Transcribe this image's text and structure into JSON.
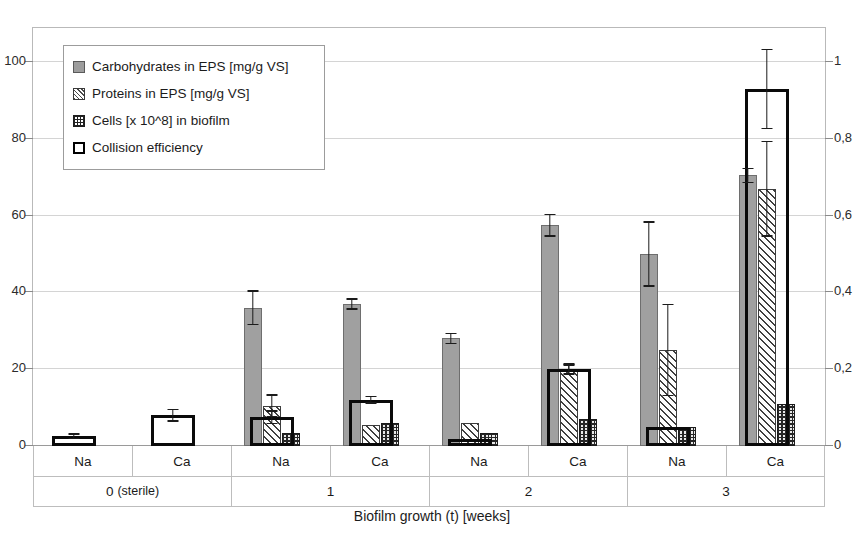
{
  "chart_data": {
    "type": "bar",
    "title": "",
    "xlabel": "Biofilm growth (t) [weeks]",
    "ylabel": "",
    "ylim": [
      0,
      110
    ],
    "y2lim": [
      0,
      1.1
    ],
    "yticks": [
      "0",
      "20",
      "40",
      "60",
      "80",
      "100"
    ],
    "ytick_values": [
      0,
      20,
      40,
      60,
      80,
      100
    ],
    "y2ticks": [
      "0",
      "0,2",
      "0,4",
      "0,6",
      "0,8",
      "1"
    ],
    "y2tick_values": [
      0,
      0.2,
      0.4,
      0.6,
      0.8,
      1
    ],
    "grid": true,
    "legend_position": "top-left",
    "categories": [
      "Na",
      "Ca",
      "Na",
      "Ca",
      "Na",
      "Ca",
      "Na",
      "Ca"
    ],
    "groups": [
      {
        "label": "0",
        "sublabel": "(sterile)",
        "span": 2
      },
      {
        "label": "1",
        "sublabel": "",
        "span": 2
      },
      {
        "label": "2",
        "sublabel": "",
        "span": 2
      },
      {
        "label": "3",
        "sublabel": "",
        "span": 2
      }
    ],
    "series": [
      {
        "name": "Carbohydrates in EPS [mg/g VS]",
        "axis": "left",
        "values": [
          0,
          0,
          36.0,
          37.0,
          28.0,
          57.5,
          50.0,
          70.5
        ],
        "errors": [
          0,
          0,
          4.5,
          1.5,
          1.5,
          3.0,
          8.5,
          2.0
        ]
      },
      {
        "name": "Proteins in EPS [mg/g VS]",
        "axis": "left",
        "values": [
          0,
          0,
          10.5,
          5.5,
          6.0,
          20.0,
          25.0,
          67.0
        ],
        "errors": [
          0,
          0,
          3.0,
          0,
          0,
          1.5,
          12.0,
          12.5
        ]
      },
      {
        "name": "Cells [x 10^8] in biofilm",
        "axis": "left",
        "values": [
          0,
          0,
          3.5,
          6.0,
          3.5,
          7.0,
          5.0,
          11.0
        ],
        "errors": [
          0,
          0,
          0,
          0,
          0,
          0,
          0,
          0
        ]
      },
      {
        "name": "Collision efficiency",
        "axis": "right",
        "values": [
          0.025,
          0.08,
          0.075,
          0.12,
          0.01,
          0.2,
          0.05,
          0.93
        ],
        "errors": [
          0.008,
          0.017,
          0.018,
          0.01,
          0,
          0.013,
          0,
          0.105
        ]
      }
    ]
  },
  "legend": {
    "items": [
      {
        "swatch": "carbohydrates-swatch",
        "label": "Carbohydrates in EPS [mg/g VS]"
      },
      {
        "swatch": "proteins-swatch",
        "label": "Proteins in EPS [mg/g VS]"
      },
      {
        "swatch": "cells-swatch",
        "label": "Cells [x 10^8] in biofilm"
      },
      {
        "swatch": "collision-efficiency-swatch",
        "label": "Collision efficiency"
      }
    ]
  },
  "axis": {
    "x_title": "Biofilm growth (t) [weeks]"
  },
  "colors": {
    "carbohydrates": "#a0a0a0",
    "proteins": "#ffffff",
    "cells": "#262626",
    "collision": "#0a0a0a",
    "grid": "#d4d4d4",
    "frame": "#b9b9b9"
  }
}
